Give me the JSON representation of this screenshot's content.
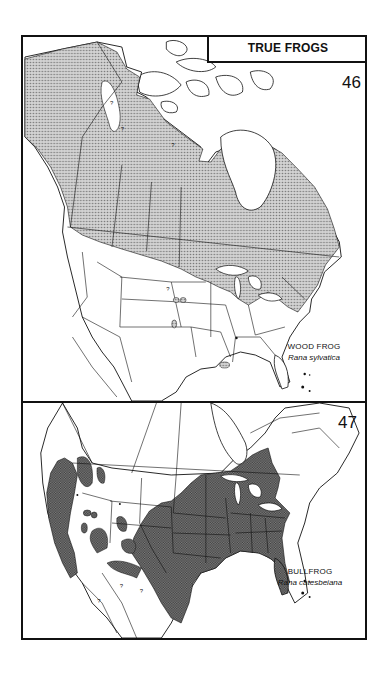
{
  "page": {
    "section_title": "TRUE FROGS"
  },
  "maps": [
    {
      "number": "46",
      "common_name": "WOOD FROG",
      "scientific_name": "Rana sylvatica",
      "range_fill": "stippled",
      "range_color": "#a9a9a9",
      "uncertain_markers": [
        "?",
        "?",
        "?",
        "?"
      ]
    },
    {
      "number": "47",
      "common_name": "BULLFROG",
      "scientific_name": "Rana catesbeiana",
      "range_fill": "crosshatched",
      "range_color": "#6e6e6e",
      "uncertain_markers": [
        "?",
        "?",
        "?"
      ]
    }
  ],
  "colors": {
    "ink": "#111111",
    "paper": "#ffffff",
    "stipple": "#9a9a9a",
    "crosshatch": "#5f5f5f"
  }
}
